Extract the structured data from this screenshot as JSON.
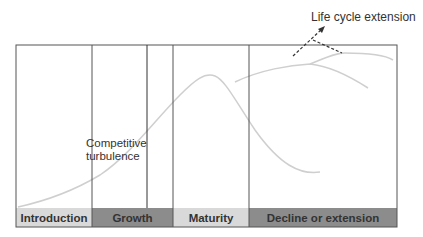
{
  "annotations": {
    "life_cycle_extension": "Life cycle extension",
    "competitive_line1": "Competitive",
    "competitive_line2": "turbulence"
  },
  "stages": [
    {
      "label": "Introduction",
      "fill": "#d9d9d9"
    },
    {
      "label": "Growth",
      "fill": "#8c8c8c"
    },
    {
      "label": "Maturity",
      "fill": "#d9d9d9"
    },
    {
      "label": "Decline or extension",
      "fill": "#8c8c8c"
    }
  ],
  "colors": {
    "frame": "#555555",
    "curve": "#cfcfcf",
    "dashed": "#333333"
  }
}
